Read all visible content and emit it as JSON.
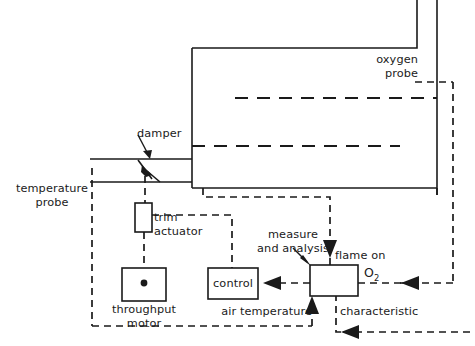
{
  "diagram": {
    "colors": {
      "line": "#1a1a1a",
      "background": "#ffffff"
    },
    "labels": {
      "oxygen_probe": "oxygen\nprobe",
      "oxygen_probe_line1": "oxygen",
      "oxygen_probe_line2": "probe",
      "damper": "damper",
      "temperature_probe_line1": "temperature",
      "temperature_probe_line2": "probe",
      "trim_actuator_line1": "trim",
      "trim_actuator_line2": "actuator",
      "throughput_motor_line1": "throughput",
      "throughput_motor_line2": "motor",
      "control": "control",
      "measure_line1": "measure",
      "measure_line2": "and analysis",
      "flame_on": "flame on",
      "o2_text": "O",
      "o2_subscript": "2",
      "air_temperature": "air temperature",
      "characteristic": "characteristic"
    },
    "components": [
      {
        "id": "boiler",
        "name": "boiler vessel"
      },
      {
        "id": "stack",
        "name": "flue stack"
      },
      {
        "id": "air-duct",
        "name": "combustion air duct"
      },
      {
        "id": "damper",
        "name": "damper"
      },
      {
        "id": "trim-actuator",
        "name": "trim actuator"
      },
      {
        "id": "throughput-motor",
        "name": "throughput motor"
      },
      {
        "id": "control",
        "name": "control"
      },
      {
        "id": "analysis",
        "name": "measure and analysis"
      },
      {
        "id": "oxygen-probe",
        "name": "oxygen probe"
      },
      {
        "id": "temperature-probe",
        "name": "temperature probe"
      }
    ],
    "signals": [
      {
        "id": "o2-signal",
        "name": "O2",
        "from": "oxygen-probe",
        "to": "analysis"
      },
      {
        "id": "flame-on-signal",
        "name": "flame on",
        "from": "boiler",
        "to": "analysis"
      },
      {
        "id": "air-temperature-signal",
        "name": "air temperature",
        "from": "temperature-probe",
        "to": "analysis"
      },
      {
        "id": "characteristic-signal",
        "name": "characteristic",
        "from": "external",
        "to": "analysis"
      },
      {
        "id": "control-signal",
        "name": "control command",
        "from": "analysis",
        "to": "control"
      },
      {
        "id": "trim-signal",
        "name": "trim command",
        "from": "control",
        "to": "trim-actuator"
      }
    ]
  }
}
